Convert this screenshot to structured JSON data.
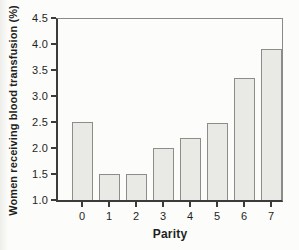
{
  "chart_data": {
    "type": "bar",
    "title": "",
    "xlabel": "Parity",
    "ylabel": "Women receiving blood transfusion (%)",
    "categories": [
      "0",
      "1",
      "2",
      "3",
      "4",
      "5",
      "6",
      "7"
    ],
    "values": [
      2.5,
      1.5,
      1.5,
      2.0,
      2.2,
      2.48,
      3.35,
      3.9
    ],
    "ylim": [
      1.0,
      4.5
    ],
    "ytick_labels": [
      "1.0",
      "1.5",
      "2.0",
      "2.5",
      "3.0",
      "3.5",
      "4.0",
      "4.5"
    ],
    "grid": false,
    "legend": "none",
    "colors": {
      "bar_fill": "#e9e9e5",
      "bar_border": "#8c8c89",
      "axis": "#3b3b3b",
      "frame": "#8a8a8a",
      "text": "#1f1f1f",
      "background": "#fcfcfa"
    }
  }
}
